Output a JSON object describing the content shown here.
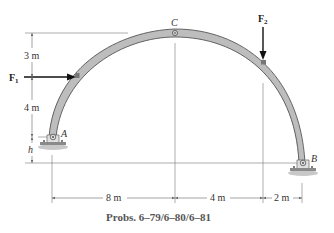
{
  "figure": {
    "caption": "Probs. 6–79/6–80/6–81",
    "colors": {
      "arch_fill": "#bdbdbd",
      "arch_stroke": "#555555",
      "arrow": "#111111",
      "dim_line": "#666666",
      "ground": "#9a9a9a",
      "bracket": "#777777"
    },
    "points": {
      "A": "A",
      "B": "B",
      "C": "C"
    },
    "forces": {
      "F1": {
        "symbol": "F",
        "subscript": "1",
        "direction": "right"
      },
      "F2": {
        "symbol": "F",
        "subscript": "2",
        "direction": "down"
      }
    },
    "dimensions": {
      "vertical": [
        "3 m",
        "4 m",
        "h"
      ],
      "horizontal": [
        "8 m",
        "4 m",
        "2 m"
      ]
    }
  }
}
